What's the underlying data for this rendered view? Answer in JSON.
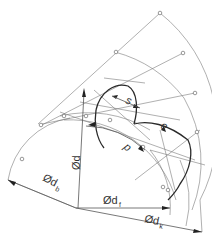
{
  "diagram": {
    "type": "involute gear tooth construction",
    "labels": {
      "pitch_diameter": "Ød",
      "base_diameter": "Ød",
      "base_diameter_sub": "b",
      "root_diameter": "Ød",
      "root_diameter_sub": "f",
      "tip_diameter": "Ød",
      "tip_diameter_sub": "k",
      "tooth_thickness": "s",
      "space_width": "e",
      "pitch": "p"
    },
    "colors": {
      "line": "#555555",
      "background": "#ffffff"
    }
  }
}
